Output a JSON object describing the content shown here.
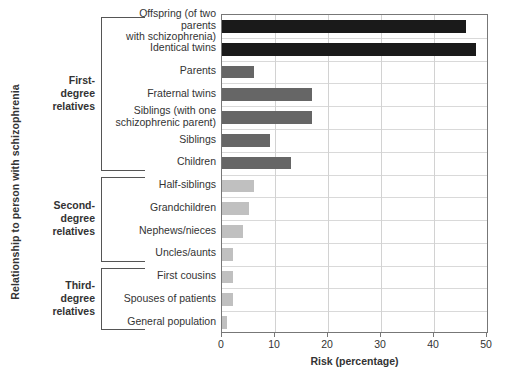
{
  "chart_data": {
    "type": "bar",
    "orientation": "horizontal",
    "title": "",
    "xlabel": "Risk (percentage)",
    "ylabel": "Relationship to person with schizophrenia",
    "xlim": [
      0,
      50
    ],
    "xticks": [
      0,
      10,
      20,
      30,
      40,
      50
    ],
    "xtick_labels": [
      "0",
      "10",
      "20",
      "30",
      "40",
      "50"
    ],
    "grid": "vertical-and-horizontal",
    "legend": "none",
    "categories": [
      "Offspring (of two parents\nwith schizophrenia)",
      "Identical twins",
      "Parents",
      "Fraternal twins",
      "Siblings (with one\nschizophrenic parent)",
      "Siblings",
      "Children",
      "Half-siblings",
      "Grandchildren",
      "Nephews/nieces",
      "Uncles/aunts",
      "First cousins",
      "Spouses  of patients",
      "General population"
    ],
    "values": [
      46,
      48,
      6,
      17,
      17,
      9,
      13,
      6,
      5,
      4,
      2,
      2,
      2,
      1
    ],
    "bar_colors": [
      "#1a1a1a",
      "#1a1a1a",
      "#666666",
      "#666666",
      "#666666",
      "#666666",
      "#666666",
      "#c0c0c0",
      "#c0c0c0",
      "#c0c0c0",
      "#c0c0c0",
      "#c0c0c0",
      "#c0c0c0",
      "#c0c0c0"
    ],
    "groups": [
      {
        "label": "First-\ndegree\nrelatives",
        "start_index": 0,
        "end_index": 6
      },
      {
        "label": "Second-\ndegree\nrelatives",
        "start_index": 7,
        "end_index": 10
      },
      {
        "label": "Third-\ndegree\nrelatives",
        "start_index": 11,
        "end_index": 13
      }
    ]
  },
  "colors": {
    "bar_dark": "#1a1a1a",
    "bar_mid": "#666666",
    "bar_light": "#c0c0c0",
    "axis": "#777777",
    "gridline": "#d2d2d2",
    "text": "#333333"
  }
}
